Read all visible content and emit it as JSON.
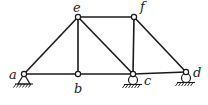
{
  "diagram": {
    "type": "truss",
    "nodes": [
      {
        "id": "a",
        "label": "a",
        "x": 24,
        "y": 74,
        "lx": 9,
        "ly": 79
      },
      {
        "id": "b",
        "label": "b",
        "x": 78,
        "y": 74,
        "lx": 74,
        "ly": 93
      },
      {
        "id": "c",
        "label": "c",
        "x": 133,
        "y": 74,
        "lx": 144,
        "ly": 85
      },
      {
        "id": "d",
        "label": "d",
        "x": 186,
        "y": 72,
        "lx": 193,
        "ly": 77
      },
      {
        "id": "e",
        "label": "e",
        "x": 78,
        "y": 17,
        "lx": 73,
        "ly": 12
      },
      {
        "id": "f",
        "label": "f",
        "x": 134,
        "y": 17,
        "lx": 140,
        "ly": 11
      }
    ],
    "members": [
      [
        "a",
        "b"
      ],
      [
        "b",
        "c"
      ],
      [
        "c",
        "d"
      ],
      [
        "a",
        "e"
      ],
      [
        "e",
        "b"
      ],
      [
        "e",
        "c"
      ],
      [
        "e",
        "f"
      ],
      [
        "f",
        "c"
      ],
      [
        "f",
        "d"
      ]
    ],
    "supports": [
      {
        "node": "a",
        "type": "pin"
      },
      {
        "node": "c",
        "type": "roller"
      },
      {
        "node": "d",
        "type": "roller"
      }
    ]
  }
}
